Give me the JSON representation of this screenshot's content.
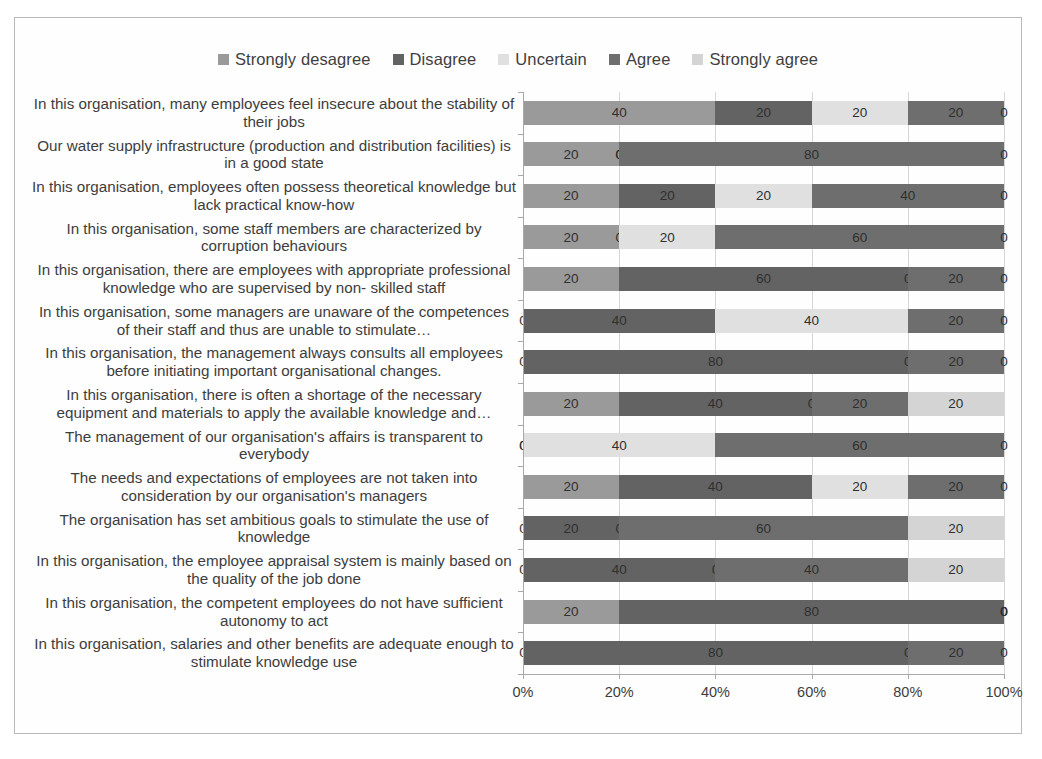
{
  "chart_data": {
    "type": "bar",
    "subtype": "stacked-horizontal-100",
    "title": "",
    "xlabel": "",
    "ylabel": "",
    "xlim": [
      0,
      100
    ],
    "grid": true,
    "legend_position": "top",
    "x_ticks": [
      "0%",
      "20%",
      "40%",
      "60%",
      "80%",
      "100%"
    ],
    "x_tick_values": [
      0,
      20,
      40,
      60,
      80,
      100
    ],
    "series": [
      {
        "name": "Strongly desagree",
        "color": "#9a9a9a",
        "values": [
          40,
          20,
          20,
          20,
          20,
          0,
          0,
          20,
          0,
          20,
          0,
          0,
          20,
          0
        ]
      },
      {
        "name": "Disagree",
        "color": "#636363",
        "values": [
          20,
          0,
          20,
          0,
          60,
          40,
          80,
          40,
          0,
          40,
          20,
          40,
          80,
          80
        ]
      },
      {
        "name": "Uncertain",
        "color": "#e0e0e0",
        "values": [
          20,
          0,
          20,
          20,
          0,
          40,
          0,
          0,
          40,
          20,
          0,
          0,
          0,
          0
        ]
      },
      {
        "name": "Agree",
        "color": "#6e6e6e",
        "values": [
          20,
          80,
          40,
          60,
          20,
          20,
          20,
          20,
          60,
          20,
          60,
          40,
          0,
          20
        ]
      },
      {
        "name": "Strongly agree",
        "color": "#d4d4d4",
        "values": [
          0,
          0,
          0,
          0,
          0,
          0,
          0,
          20,
          0,
          0,
          20,
          20,
          0,
          0
        ]
      }
    ],
    "categories": [
      "In this organisation, many employees feel insecure about the stability of their jobs",
      "Our water supply infrastructure (production and distribution facilities) is in a good state",
      "In this organisation, employees often possess theoretical knowledge but lack practical know-how",
      "In this organisation, some staff members are characterized by corruption behaviours",
      "In this organisation, there are employees with appropriate professional knowledge who are supervised by non- skilled staff",
      "In this organisation, some managers are unaware of the competences of their staff and thus are unable to stimulate…",
      "In this organisation, the management always consults all employees before initiating important organisational changes.",
      "In this organisation, there is often a shortage of the necessary equipment and materials to apply the available knowledge and…",
      "The management of our organisation's affairs is transparent to everybody",
      "The needs and expectations of employees are not taken into consideration by our organisation's managers",
      "The organisation has set ambitious goals to stimulate the use of knowledge",
      "In this organisation, the employee appraisal system  is mainly based on the quality of the job done",
      "In this organisation, the competent employees do not have sufficient autonomy to act",
      "In this organisation, salaries and other benefits are adequate enough to stimulate knowledge use"
    ]
  },
  "legend": {
    "items": [
      {
        "label": "Strongly desagree",
        "color": "#9a9a9a"
      },
      {
        "label": "Disagree",
        "color": "#636363"
      },
      {
        "label": "Uncertain",
        "color": "#e0e0e0"
      },
      {
        "label": "Agree",
        "color": "#6e6e6e"
      },
      {
        "label": "Strongly agree",
        "color": "#d4d4d4"
      }
    ]
  }
}
